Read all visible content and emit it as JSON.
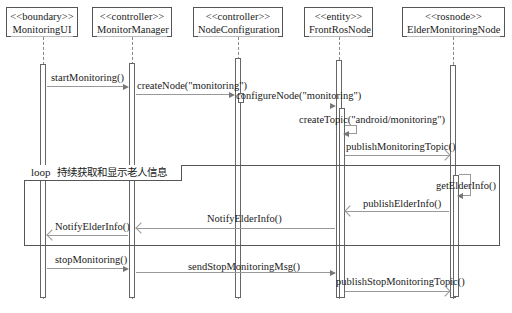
{
  "diagram_type": "sequence",
  "participants": [
    {
      "id": "ui",
      "stereotype": "<<boundary>>",
      "name": "MonitoringUI"
    },
    {
      "id": "mgr",
      "stereotype": "<<controller>>",
      "name": "MonitorManager"
    },
    {
      "id": "cfg",
      "stereotype": "<<controller>>",
      "name": "NodeConfiguration"
    },
    {
      "id": "front",
      "stereotype": "<<entity>>",
      "name": "FrontRosNode"
    },
    {
      "id": "elder",
      "stereotype": "<<rosnode>>",
      "name": "ElderMonitoringNode"
    }
  ],
  "messages": [
    {
      "from": "ui",
      "to": "mgr",
      "label": "startMonitoring()"
    },
    {
      "from": "mgr",
      "to": "cfg",
      "label": "createNode(\"monitoring\")"
    },
    {
      "from": "cfg",
      "to": "cfg",
      "label": "configureNode(\"monitoring\")"
    },
    {
      "from": "front",
      "to": "front",
      "label": "createTopic(\"android/monitoring\")"
    },
    {
      "from": "front",
      "to": "elder",
      "label": "publishMonitoringTopic()"
    },
    {
      "from": "elder",
      "to": "elder",
      "label": "getElderInfo()"
    },
    {
      "from": "elder",
      "to": "front",
      "label": "publishElderInfo()"
    },
    {
      "from": "front",
      "to": "mgr",
      "label": "NotifyElderInfo()"
    },
    {
      "from": "mgr",
      "to": "ui",
      "label": "NotifyElderInfo()"
    },
    {
      "from": "ui",
      "to": "mgr",
      "label": "stopMonitoring()"
    },
    {
      "from": "mgr",
      "to": "front",
      "label": "sendStopMonitoringMsg()"
    },
    {
      "from": "front",
      "to": "elder",
      "label": "publishStopMonitoringTopic()"
    }
  ],
  "fragments": [
    {
      "operator": "loop",
      "guard": "持续获取和显示老人信息"
    }
  ]
}
